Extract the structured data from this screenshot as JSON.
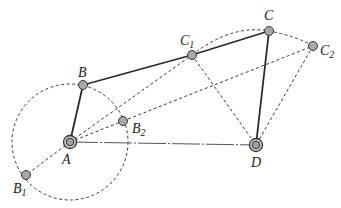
{
  "figure": {
    "type": "four-bar linkage diagram",
    "colors": {
      "link": "#2a2a2a",
      "dashed": "#3a3a3a",
      "joint_fill": "#a8a8a8",
      "joint_stroke": "#333333",
      "background": "#ffffff"
    },
    "points": {
      "A": {
        "label": "A",
        "sub": "",
        "x": 70,
        "y": 142
      },
      "B": {
        "label": "B",
        "sub": "",
        "x": 83,
        "y": 85
      },
      "B1": {
        "label": "B",
        "sub": "1",
        "x": 26,
        "y": 175
      },
      "B2": {
        "label": "B",
        "sub": "2",
        "x": 123,
        "y": 121
      },
      "C": {
        "label": "C",
        "sub": "",
        "x": 269,
        "y": 31
      },
      "C1": {
        "label": "C",
        "sub": "1",
        "x": 192,
        "y": 55
      },
      "C2": {
        "label": "C",
        "sub": "2",
        "x": 313,
        "y": 46
      },
      "D": {
        "label": "D",
        "sub": "",
        "x": 256,
        "y": 145
      }
    },
    "links_solid": [
      [
        "A",
        "B"
      ],
      [
        "B",
        "C1"
      ],
      [
        "C1",
        "C"
      ],
      [
        "C",
        "D"
      ]
    ],
    "ground_line": [
      "A",
      "D"
    ],
    "links_dashed": [
      [
        "A",
        "B1"
      ],
      [
        "A",
        "B2"
      ],
      [
        "A",
        "C1"
      ],
      [
        "A",
        "C2"
      ],
      [
        "B2",
        "C1"
      ],
      [
        "C1",
        "D"
      ],
      [
        "C2",
        "D"
      ],
      [
        "C",
        "C2"
      ]
    ],
    "crank_circle": {
      "center": "A",
      "radius": 58
    },
    "coupler_arc": {
      "from": "C1",
      "through": "C",
      "to": "C2"
    }
  }
}
